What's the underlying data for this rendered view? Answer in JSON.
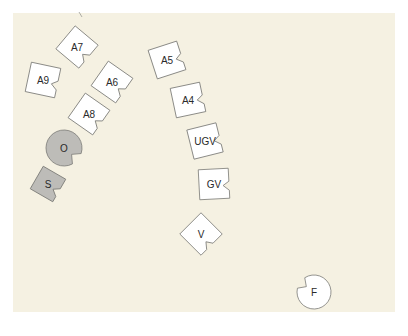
{
  "background": {
    "color": "#f5f1e2"
  },
  "colors": {
    "white_tile_fill": "#ffffff",
    "gray_tile_fill": "#bdbcb8",
    "stroke": "#7a7a76"
  },
  "tiles": [
    {
      "id": "A7",
      "label": "A7",
      "shape": "notched-square",
      "fill": "white",
      "cx": 77,
      "cy": 47,
      "rot": 40
    },
    {
      "id": "A9",
      "label": "A9",
      "shape": "notched-square",
      "fill": "white",
      "cx": 43,
      "cy": 80,
      "rot": 12
    },
    {
      "id": "A6",
      "label": "A6",
      "shape": "notched-square",
      "fill": "white",
      "cx": 112,
      "cy": 82,
      "rot": 35
    },
    {
      "id": "A8",
      "label": "A8",
      "shape": "notched-square",
      "fill": "white",
      "cx": 89,
      "cy": 114,
      "rot": 35
    },
    {
      "id": "A5",
      "label": "A5",
      "shape": "notched-square",
      "fill": "white",
      "cx": 167,
      "cy": 60,
      "rot": -18
    },
    {
      "id": "A4",
      "label": "A4",
      "shape": "notched-square",
      "fill": "white",
      "cx": 188,
      "cy": 100,
      "rot": -12
    },
    {
      "id": "UGV",
      "label": "UGV",
      "shape": "notched-square",
      "fill": "white",
      "cx": 205,
      "cy": 141,
      "rot": -14
    },
    {
      "id": "GV",
      "label": "GV",
      "shape": "notched-square",
      "fill": "white",
      "cx": 214,
      "cy": 184,
      "rot": -3
    },
    {
      "id": "V",
      "label": "V",
      "shape": "notched-square",
      "fill": "white",
      "cx": 201,
      "cy": 234,
      "rot": 45
    },
    {
      "id": "S",
      "label": "S",
      "shape": "notched-square",
      "fill": "gray",
      "cx": 48,
      "cy": 184,
      "rot": 30,
      "size": 26
    },
    {
      "id": "O",
      "label": "O",
      "shape": "notched-circle",
      "fill": "gray",
      "cx": 64,
      "cy": 148,
      "r": 18
    },
    {
      "id": "F",
      "label": "F",
      "shape": "notched-circle",
      "fill": "white",
      "cx": 314,
      "cy": 292,
      "r": 17,
      "notch_angle": 215
    }
  ],
  "stray_mark": {
    "x1": 79,
    "y1": 12,
    "x2": 82,
    "y2": 17
  }
}
